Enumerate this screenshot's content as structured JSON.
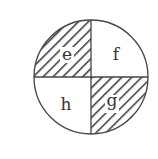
{
  "diagram": {
    "type": "circle divided into four quadrants",
    "quadrants": [
      {
        "position": "top-left",
        "label": "e",
        "shaded": true
      },
      {
        "position": "top-right",
        "label": "f",
        "shaded": false
      },
      {
        "position": "bottom-right",
        "label": "g",
        "shaded": true
      },
      {
        "position": "bottom-left",
        "label": "h",
        "shaded": false
      }
    ],
    "colors": {
      "stroke": "#444444",
      "hatch": "#333333",
      "background": "#ffffff"
    }
  }
}
